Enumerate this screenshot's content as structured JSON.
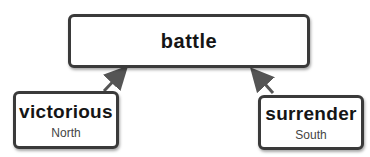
{
  "diagram": {
    "root": {
      "label": "battle"
    },
    "children": [
      {
        "label": "victorious",
        "sublabel": "North"
      },
      {
        "label": "surrender",
        "sublabel": "South"
      }
    ],
    "edges": [
      {
        "from": "victorious",
        "to": "battle"
      },
      {
        "from": "surrender",
        "to": "battle"
      }
    ],
    "colors": {
      "border": "#3a3a3a",
      "arrow": "#555555",
      "text": "#151515",
      "subtext": "#444444"
    }
  }
}
